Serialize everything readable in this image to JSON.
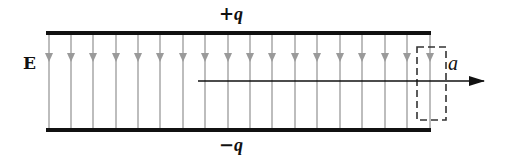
{
  "figure": {
    "type": "parallel-plate-capacitor",
    "labels": {
      "top_plate_sign": "+",
      "top_plate_symbol": "q",
      "bottom_plate_sign": "−",
      "bottom_plate_symbol": "q",
      "field": "E",
      "gaussian_surface": "a"
    },
    "colors": {
      "plate": "#111111",
      "field_line": "#9a9a9a",
      "axis_arrow": "#111111",
      "dashed_box": "#333333"
    },
    "plates": {
      "x_start": 46,
      "x_end": 431,
      "top_y": 33,
      "bottom_y": 130,
      "thickness": 4
    },
    "field_lines": {
      "count": 18,
      "x_positions": [
        49,
        71,
        93,
        116,
        138,
        160,
        183,
        205,
        228,
        250,
        272,
        295,
        317,
        340,
        362,
        385,
        407,
        430
      ],
      "arrowhead_y": 62,
      "direction": "down"
    },
    "axis": {
      "x_start": 198,
      "x_end": 484,
      "y": 81,
      "direction": "right"
    },
    "dashed_box": {
      "x": 417,
      "y": 47,
      "width": 29,
      "height": 73
    }
  }
}
